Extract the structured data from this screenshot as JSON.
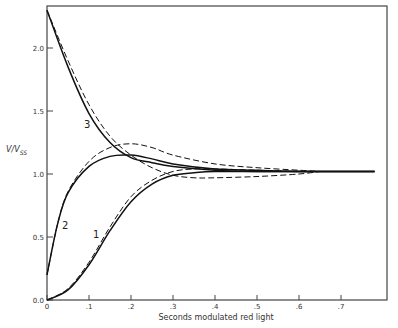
{
  "chart_data": {
    "type": "line",
    "title": "",
    "xlabel": "Seconds modulated red light",
    "ylabel": "V/V_SS",
    "ylabel_main": "V/V",
    "ylabel_sub": "SS",
    "xlim": [
      0,
      0.8
    ],
    "ylim": [
      0,
      2.35
    ],
    "x_ticks": [
      "0",
      ".1",
      ".2",
      ".3",
      ".4",
      ".5",
      ".6",
      ".7"
    ],
    "y_ticks": [
      "0.0",
      "0.5",
      "1.0",
      "1.5",
      "2.0"
    ],
    "grid": false,
    "legend": "none; curves labeled inline 1, 2, 3",
    "curve_labels": [
      "1",
      "2",
      "3"
    ],
    "series": [
      {
        "name": "1",
        "style": "solid",
        "x": [
          0,
          0.05,
          0.1,
          0.15,
          0.2,
          0.25,
          0.3,
          0.35,
          0.4,
          0.5,
          0.6,
          0.78
        ],
        "y": [
          0,
          0.08,
          0.28,
          0.55,
          0.78,
          0.92,
          0.99,
          1.01,
          1.02,
          1.02,
          1.02,
          1.02
        ]
      },
      {
        "name": "1 (model)",
        "style": "dashed",
        "x": [
          0,
          0.05,
          0.1,
          0.15,
          0.2,
          0.25,
          0.3,
          0.35,
          0.4,
          0.5,
          0.6,
          0.65
        ],
        "y": [
          0,
          0.09,
          0.3,
          0.58,
          0.82,
          0.95,
          1.02,
          1.04,
          1.04,
          1.03,
          1.02,
          1.02
        ]
      },
      {
        "name": "2",
        "style": "solid",
        "x": [
          0,
          0.025,
          0.05,
          0.1,
          0.15,
          0.2,
          0.25,
          0.3,
          0.4,
          0.5,
          0.6,
          0.78
        ],
        "y": [
          0.2,
          0.6,
          0.85,
          1.06,
          1.14,
          1.15,
          1.12,
          1.08,
          1.04,
          1.03,
          1.02,
          1.02
        ]
      },
      {
        "name": "2 (model)",
        "style": "dashed",
        "x": [
          0,
          0.025,
          0.05,
          0.1,
          0.15,
          0.2,
          0.25,
          0.3,
          0.4,
          0.5,
          0.6,
          0.65
        ],
        "y": [
          0.2,
          0.6,
          0.86,
          1.1,
          1.21,
          1.24,
          1.21,
          1.15,
          1.08,
          1.05,
          1.03,
          1.02
        ]
      },
      {
        "name": "3",
        "style": "solid",
        "x": [
          0,
          0.05,
          0.1,
          0.15,
          0.2,
          0.25,
          0.3,
          0.4,
          0.5,
          0.6,
          0.78
        ],
        "y": [
          2.3,
          1.85,
          1.48,
          1.25,
          1.13,
          1.09,
          1.06,
          1.03,
          1.02,
          1.02,
          1.02
        ]
      },
      {
        "name": "3 (model)",
        "style": "dashed",
        "x": [
          0,
          0.05,
          0.1,
          0.15,
          0.2,
          0.25,
          0.3,
          0.35,
          0.4,
          0.5,
          0.6,
          0.65
        ],
        "y": [
          2.3,
          1.9,
          1.55,
          1.3,
          1.15,
          1.05,
          0.99,
          0.97,
          0.97,
          0.98,
          1.0,
          1.02
        ]
      }
    ]
  }
}
